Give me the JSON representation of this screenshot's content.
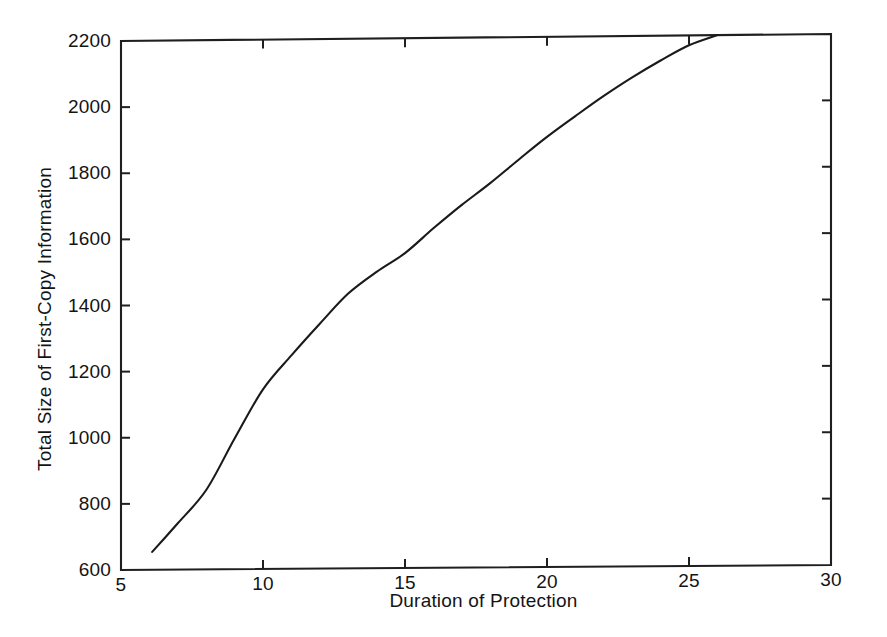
{
  "chart_data": {
    "type": "line",
    "title": "",
    "xlabel": "Duration of Protection",
    "ylabel": "Total Size of First-Copy Information",
    "xlim": [
      5,
      30
    ],
    "ylim": [
      600,
      2200
    ],
    "xticks": [
      "5",
      "10",
      "15",
      "20",
      "25",
      "30"
    ],
    "yticks": [
      "600",
      "800",
      "1000",
      "1200",
      "1400",
      "1600",
      "1800",
      "2000",
      "2200"
    ],
    "grid": false,
    "legend": "none",
    "line_color": "#1a1a1a",
    "series": [
      {
        "name": "Total Size of First-Copy Information",
        "x": [
          6.1,
          7,
          8,
          9,
          10,
          11,
          12,
          13,
          14,
          15,
          16,
          17,
          18,
          19,
          20,
          21,
          22,
          23,
          24,
          25,
          26
        ],
        "values": [
          654,
          740,
          840,
          995,
          1143,
          1245,
          1340,
          1430,
          1495,
          1551,
          1625,
          1695,
          1760,
          1830,
          1898,
          1960,
          2020,
          2075,
          2125,
          2170,
          2205
        ]
      }
    ]
  },
  "axis": {
    "tick_direction": "in",
    "box": true
  }
}
